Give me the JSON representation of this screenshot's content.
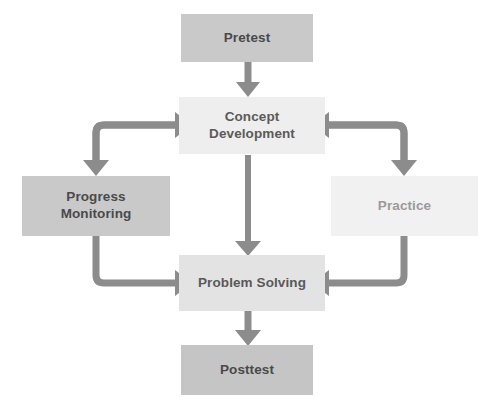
{
  "diagram": {
    "type": "flowchart",
    "background_color": "#ffffff",
    "connector_color": "#8c8c8c",
    "nodes": [
      {
        "id": "pretest",
        "label": "Pretest",
        "fill": "#c9c9c9",
        "text_color": "#4a4a4a",
        "row": "top"
      },
      {
        "id": "concept_development",
        "label": "Concept\nDevelopment",
        "fill": "#eeeeee",
        "text_color": "#5a5a5a",
        "row": "upper-middle"
      },
      {
        "id": "progress_monitoring",
        "label": "Progress\nMonitoring",
        "fill": "#c9c9c9",
        "text_color": "#4a4a4a",
        "row": "middle-left"
      },
      {
        "id": "practice",
        "label": "Practice",
        "fill": "#f1f1f1",
        "text_color": "#9a9a9a",
        "row": "middle-right"
      },
      {
        "id": "problem_solving",
        "label": "Problem Solving",
        "fill": "#e3e3e3",
        "text_color": "#595959",
        "row": "lower-middle"
      },
      {
        "id": "posttest",
        "label": "Posttest",
        "fill": "#c5c5c5",
        "text_color": "#4a4a4a",
        "row": "bottom"
      }
    ],
    "connectors": [
      {
        "id": "pretest-to-concept",
        "from": "pretest",
        "to": "concept_development",
        "shape": "straight-down"
      },
      {
        "id": "concept-to-progress",
        "from": "concept_development",
        "to": "progress_monitoring",
        "shape": "elbow-left-down"
      },
      {
        "id": "progress-to-concept",
        "from": "progress_monitoring",
        "to": "concept_development",
        "shape": "elbow-up-right"
      },
      {
        "id": "concept-to-practice",
        "from": "concept_development",
        "to": "practice",
        "shape": "elbow-right-down"
      },
      {
        "id": "practice-to-concept",
        "from": "practice",
        "to": "concept_development",
        "shape": "elbow-up-left"
      },
      {
        "id": "concept-to-problem",
        "from": "concept_development",
        "to": "problem_solving",
        "shape": "straight-down"
      },
      {
        "id": "progress-to-problem",
        "from": "progress_monitoring",
        "to": "problem_solving",
        "shape": "elbow-down-right"
      },
      {
        "id": "practice-to-problem",
        "from": "practice",
        "to": "problem_solving",
        "shape": "elbow-down-left"
      },
      {
        "id": "problem-to-posttest",
        "from": "problem_solving",
        "to": "posttest",
        "shape": "straight-down"
      }
    ]
  }
}
